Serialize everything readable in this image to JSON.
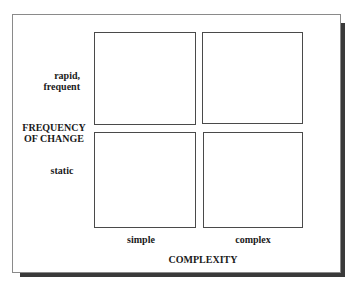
{
  "diagram": {
    "type": "2x2 matrix",
    "y_axis": {
      "title_line1": "FREQUENCY",
      "title_line2": "OF CHANGE",
      "levels": [
        {
          "line1": "rapid,",
          "line2": "frequent"
        },
        {
          "line1": "static"
        }
      ]
    },
    "x_axis": {
      "title": "COMPLEXITY",
      "levels": [
        "simple",
        "complex"
      ]
    },
    "cells": [
      {
        "row": "rapid, frequent",
        "col": "simple",
        "text": ""
      },
      {
        "row": "rapid, frequent",
        "col": "complex",
        "text": ""
      },
      {
        "row": "static",
        "col": "simple",
        "text": ""
      },
      {
        "row": "static",
        "col": "complex",
        "text": ""
      }
    ]
  }
}
